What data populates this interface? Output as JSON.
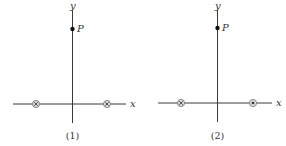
{
  "figure": {
    "panels": [
      {
        "caption": "(1)",
        "x_label": "x",
        "y_label": "y",
        "point_label": "P",
        "left_source": "into-page",
        "right_source": "into-page"
      },
      {
        "caption": "(2)",
        "x_label": "x",
        "y_label": "y",
        "point_label": "P",
        "left_source": "into-page",
        "right_source": "out-of-page"
      }
    ],
    "colors": {
      "axis": "#3a3a3a",
      "source_ring": "#9a9a9a",
      "source_mark": "#444444",
      "point": "#111111"
    }
  }
}
